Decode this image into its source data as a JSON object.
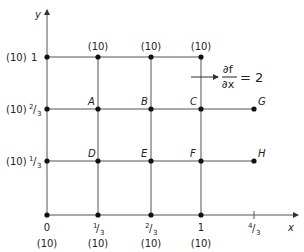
{
  "diagram": {
    "axes": {
      "x_label": "x",
      "y_label": "y",
      "x_ticks": [
        {
          "num": "0",
          "den": "",
          "boundary": "(10)"
        },
        {
          "num": "1",
          "den": "3",
          "boundary": "(10)"
        },
        {
          "num": "2",
          "den": "3",
          "boundary": "(10)"
        },
        {
          "num": "1",
          "den": "",
          "boundary": "(10)"
        },
        {
          "num": "4",
          "den": "3",
          "boundary": ""
        }
      ],
      "y_ticks": [
        {
          "boundary": "(10)",
          "num": "1",
          "den": "3"
        },
        {
          "boundary": "(10)",
          "num": "2",
          "den": "3"
        },
        {
          "boundary": "(10)",
          "num": "1",
          "den": ""
        }
      ]
    },
    "top_boundary": [
      "(10)",
      "(10)",
      "(10)"
    ],
    "points": {
      "A": "A",
      "B": "B",
      "C": "C",
      "D": "D",
      "E": "E",
      "F": "F",
      "G": "G",
      "H": "H"
    },
    "annotation": {
      "numerator": "∂f",
      "denominator": "∂x",
      "equals": "= 2"
    },
    "colors": {
      "line": "#555555",
      "dot": "#111111",
      "text": "#222222"
    }
  }
}
